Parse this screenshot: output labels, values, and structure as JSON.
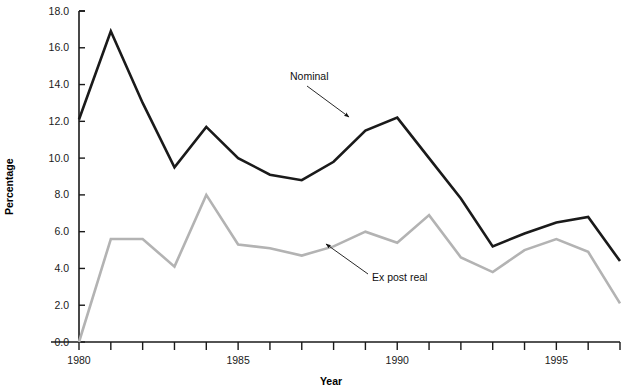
{
  "chart_data": {
    "type": "line",
    "title": "",
    "xlabel": "Year",
    "ylabel": "Percentage",
    "xlim": [
      1980,
      1997
    ],
    "ylim": [
      0.0,
      18.0
    ],
    "grid": false,
    "legend_position": "inline-annotations",
    "x": [
      1980,
      1981,
      1982,
      1983,
      1984,
      1985,
      1986,
      1987,
      1988,
      1989,
      1990,
      1991,
      1992,
      1993,
      1994,
      1995,
      1996,
      1997
    ],
    "xtick_values": [
      1980,
      1981,
      1982,
      1983,
      1984,
      1985,
      1986,
      1987,
      1988,
      1989,
      1990,
      1991,
      1992,
      1993,
      1994,
      1995,
      1996,
      1997
    ],
    "xtick_labels": [
      "1980",
      "",
      "",
      "",
      "",
      "1985",
      "",
      "",
      "",
      "",
      "1990",
      "",
      "",
      "",
      "",
      "1995",
      "",
      ""
    ],
    "ytick_values": [
      0.0,
      2.0,
      4.0,
      6.0,
      8.0,
      10.0,
      12.0,
      14.0,
      16.0,
      18.0
    ],
    "ytick_labels": [
      "0.0",
      "2.0",
      "4.0",
      "6.0",
      "8.0",
      "10.0",
      "12.0",
      "14.0",
      "16.0",
      "18.0"
    ],
    "series": [
      {
        "name": "Nominal",
        "color": "#1a1a1a",
        "width": 2.6,
        "values": [
          12.1,
          16.9,
          13.0,
          9.5,
          11.7,
          10.0,
          9.1,
          8.8,
          9.8,
          11.5,
          12.2,
          10.0,
          7.8,
          5.2,
          5.9,
          6.5,
          6.8,
          4.4
        ],
        "annotation": {
          "label": "Nominal",
          "label_x": 290,
          "label_y": 80,
          "arrow_from_x": 307,
          "arrow_from_y": 86,
          "arrow_to_x": 349,
          "arrow_to_y": 117
        }
      },
      {
        "name": "Ex post real",
        "color": "#b3b3b3",
        "width": 2.6,
        "values": [
          0.0,
          5.6,
          5.6,
          4.1,
          8.0,
          5.3,
          5.1,
          4.7,
          5.2,
          6.0,
          5.4,
          6.9,
          4.6,
          3.8,
          5.0,
          5.6,
          4.9,
          2.1
        ],
        "annotation": {
          "label": "Ex post real",
          "label_x": 372,
          "label_y": 281,
          "arrow_from_x": 368,
          "arrow_from_y": 274,
          "arrow_to_x": 326,
          "arrow_to_y": 244
        }
      }
    ]
  },
  "axes": {
    "y_axis_title": "Percentage",
    "x_axis_title": "Year",
    "y_labels": [
      "18.0",
      "16.0",
      "14.0",
      "12.0",
      "10.0",
      "8.0",
      "6.0",
      "4.0",
      "2.0",
      "0.0"
    ],
    "x_labels": [
      "1980",
      "1985",
      "1990",
      "1995"
    ]
  }
}
